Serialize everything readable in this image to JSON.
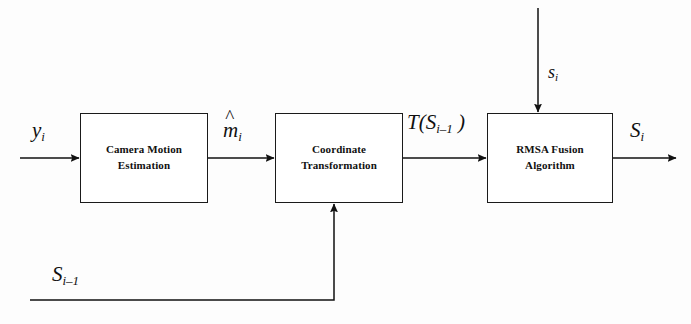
{
  "diagram": {
    "type": "block-diagram",
    "background_color": "#fdfdfd",
    "stroke_color": "#1a1a1a",
    "blocks": [
      {
        "id": "camera-motion-estimation",
        "line1": "Camera Motion",
        "line2": "Estimation",
        "x": 80,
        "y": 113,
        "w": 128,
        "h": 90
      },
      {
        "id": "coordinate-transformation",
        "line1": "Coordinate",
        "line2": "Transformation",
        "x": 275,
        "y": 113,
        "w": 128,
        "h": 90
      },
      {
        "id": "rmsa-fusion-algorithm",
        "line1": "RMSA Fusion",
        "line2": "Algorithm",
        "x": 487,
        "y": 113,
        "w": 126,
        "h": 90
      }
    ],
    "labels": {
      "input_signal": {
        "base": "y",
        "sub": "i",
        "hat": false
      },
      "motion_estimate": {
        "base": "m",
        "sub": "i",
        "hat": true
      },
      "transformed_state": {
        "prefix": "T(",
        "base": "S",
        "sub": "i–1",
        "suffix": " )"
      },
      "fusion_top_input": {
        "base": "s",
        "sub": "i",
        "hat": false
      },
      "output_state": {
        "base": "S",
        "sub": "i",
        "hat": false
      },
      "feedback_state": {
        "base": "S",
        "sub": "i–1",
        "hat": false
      }
    }
  }
}
